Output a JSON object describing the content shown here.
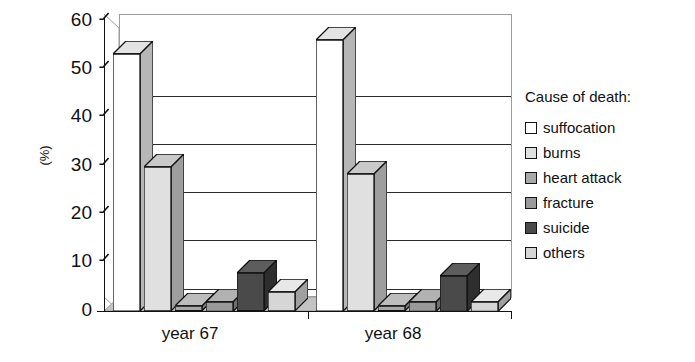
{
  "chart_data": {
    "type": "bar",
    "title": "",
    "subtitle": "",
    "xlabel": "",
    "ylabel": "(%)",
    "categories": [
      "year 67",
      "year 68"
    ],
    "ylim": [
      0,
      60
    ],
    "yticks": [
      0,
      10,
      20,
      30,
      40,
      50,
      60
    ],
    "ytick_labels": [
      "0",
      "10",
      "20",
      "30",
      "40",
      "50",
      "60"
    ],
    "grid": true,
    "grid_axis": "y",
    "legend_title": "Cause of death:",
    "legend_position": "right",
    "style": "3d-column",
    "series": [
      {
        "name": "suffocation",
        "color": "#ffffff",
        "side_color": "#b6b6b6",
        "top_color": "#e3e3e3",
        "values": [
          54.5,
          57.5
        ]
      },
      {
        "name": "burns",
        "color": "#e0e0e0",
        "side_color": "#9e9e9e",
        "top_color": "#c9c9c9",
        "values": [
          30.5,
          29.0
        ]
      },
      {
        "name": "heart attack",
        "color": "#a8a8a8",
        "side_color": "#7d7d7d",
        "top_color": "#bdbdbd",
        "values": [
          1.0,
          1.0
        ]
      },
      {
        "name": "fracture",
        "color": "#9a9a9a",
        "side_color": "#6f6f6f",
        "top_color": "#b2b2b2",
        "values": [
          2.0,
          2.0
        ]
      },
      {
        "name": "suicide",
        "color": "#4a4a4a",
        "side_color": "#2e2e2e",
        "top_color": "#5d5d5d",
        "values": [
          8.0,
          7.5
        ]
      },
      {
        "name": "others",
        "color": "#d6d6d6",
        "side_color": "#a0a0a0",
        "top_color": "#e8e8e8",
        "values": [
          4.0,
          2.0
        ]
      }
    ]
  },
  "axis": {
    "ytick_0": "0",
    "ytick_1": "10",
    "ytick_2": "20",
    "ytick_3": "30",
    "ytick_4": "40",
    "ytick_5": "50",
    "ytick_6": "60",
    "ylabel": "(%)",
    "cat_0": "year 67",
    "cat_1": "year 68"
  },
  "legend": {
    "title": "Cause of death:",
    "items": [
      {
        "label": "suffocation"
      },
      {
        "label": "burns"
      },
      {
        "label": "heart attack"
      },
      {
        "label": "fracture"
      },
      {
        "label": "suicide"
      },
      {
        "label": "others"
      }
    ]
  },
  "colors": {
    "axis": "#111111",
    "grid": "#2b2b2b",
    "wall": "#9c9c9c",
    "floor": "#c3c3c3",
    "background": "#ffffff"
  }
}
